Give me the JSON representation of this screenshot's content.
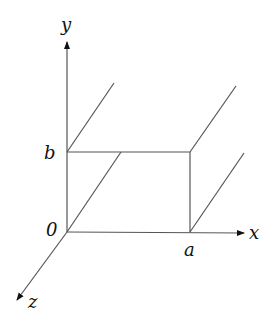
{
  "diagram": {
    "labels": {
      "y_axis": "y",
      "x_axis": "x",
      "z_axis": "z",
      "origin": "0",
      "b": "b",
      "a": "a"
    },
    "colors": {
      "line": "#555555",
      "text": "#111111"
    }
  }
}
